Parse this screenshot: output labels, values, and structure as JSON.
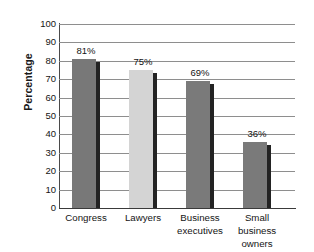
{
  "chart_data": {
    "type": "bar",
    "title": "",
    "xlabel": "",
    "ylabel": "Percentage",
    "ylim": [
      0,
      100
    ],
    "ytick_step": 10,
    "yticks": [
      100,
      90,
      80,
      70,
      60,
      50,
      40,
      30,
      20,
      10,
      0
    ],
    "grid": true,
    "legend": false,
    "categories": [
      "Congress",
      "Lawyers",
      "Business executives",
      "Small business owners"
    ],
    "category_lines": [
      [
        "Congress"
      ],
      [
        "Lawyers"
      ],
      [
        "Business",
        "executives"
      ],
      [
        "Small business",
        "owners"
      ]
    ],
    "values": [
      81,
      75,
      69,
      36
    ],
    "data_labels": [
      "81%",
      "75%",
      "69%",
      "36%"
    ],
    "bar_colors": [
      "#787878",
      "#d4d4d4",
      "#7a7a7a",
      "#7a7a7a"
    ],
    "bar_shadow_color": "#232323",
    "gridline_color": "#8e8e8e",
    "axis_color": "#3a3a3a",
    "text_color": "#141414",
    "background": "#ffffff"
  }
}
